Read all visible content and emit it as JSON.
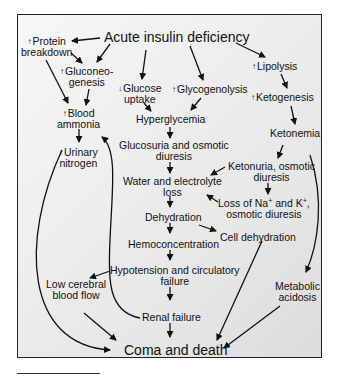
{
  "diagram": {
    "title_node": "Acute insulin deficiency",
    "nodes": {
      "protein_breakdown": {
        "prefix": "↑",
        "line1": "Protein",
        "line2": "breakdown"
      },
      "gluconeogenesis": {
        "prefix": "↑",
        "line1": "Gluconeo-",
        "line2": "genesis"
      },
      "glucose_uptake": {
        "prefix": "↓",
        "line1": "Glucose",
        "line2": "uptake"
      },
      "glycogenolysis": {
        "prefix": "↑",
        "line1": "Glycogenolysis"
      },
      "lipolysis": {
        "prefix": "↑",
        "line1": "Lipolysis"
      },
      "ketogenesis": {
        "prefix": "↑",
        "line1": "Ketogenesis"
      },
      "blood_ammonia": {
        "prefix": "↑",
        "line1": "Blood",
        "line2": "ammonia"
      },
      "urinary_nitrogen": {
        "prefix": "↑",
        "line1": "Urinary",
        "line2": "nitrogen"
      },
      "hyperglycemia": {
        "line1": "Hyperglycemia"
      },
      "ketonemia": {
        "line1": "Ketonemia"
      },
      "glucosuria": {
        "line1": "Glucosuria and osmotic",
        "line2": "diuresis"
      },
      "ketonuria": {
        "line1": "Ketonuria, osmotic",
        "line2": "diuresis"
      },
      "water_loss": {
        "line1": "Water and electrolyte",
        "line2": "loss"
      },
      "loss_na_k": {
        "line1a": "Loss of Na",
        "sup1": "+",
        "line1b": " and K",
        "sup2": "+",
        "line1c": ",",
        "line2": "osmotic diuresis"
      },
      "dehydration": {
        "line1": "Dehydration"
      },
      "cell_dehydration": {
        "line1": "Cell dehydration"
      },
      "hemoconcentration": {
        "line1": "Hemoconcentration"
      },
      "hypotension": {
        "line1": "Hypotension and circulatory",
        "line2": "failure"
      },
      "low_cerebral": {
        "line1": "Low cerebral",
        "line2": "blood flow"
      },
      "renal_failure": {
        "line1": "Renal failure"
      },
      "metabolic_acidosis": {
        "line1": "Metabolic",
        "line2": "acidosis"
      },
      "coma_death": {
        "line1": "Coma and death"
      }
    },
    "edges": [
      [
        "Acute insulin deficiency",
        "Protein breakdown"
      ],
      [
        "Acute insulin deficiency",
        "Gluconeogenesis"
      ],
      [
        "Acute insulin deficiency",
        "Glucose uptake"
      ],
      [
        "Acute insulin deficiency",
        "Glycogenolysis"
      ],
      [
        "Acute insulin deficiency",
        "Lipolysis"
      ],
      [
        "Protein breakdown",
        "Gluconeogenesis"
      ],
      [
        "Protein breakdown",
        "Blood ammonia"
      ],
      [
        "Gluconeogenesis",
        "Blood ammonia"
      ],
      [
        "Blood ammonia",
        "Urinary nitrogen"
      ],
      [
        "Blood ammonia",
        "Coma and death"
      ],
      [
        "Glucose uptake",
        "Hyperglycemia"
      ],
      [
        "Glycogenolysis",
        "Hyperglycemia"
      ],
      [
        "Lipolysis",
        "Ketogenesis"
      ],
      [
        "Ketogenesis",
        "Ketonemia"
      ],
      [
        "Hyperglycemia",
        "Glucosuria and osmotic diuresis"
      ],
      [
        "Glucosuria and osmotic diuresis",
        "Water and electrolyte loss"
      ],
      [
        "Ketonemia",
        "Ketonuria, osmotic diuresis"
      ],
      [
        "Ketonemia",
        "Metabolic acidosis"
      ],
      [
        "Ketonuria, osmotic diuresis",
        "Water and electrolyte loss"
      ],
      [
        "Ketonuria, osmotic diuresis",
        "Loss of Na+ and K+, osmotic diuresis"
      ],
      [
        "Loss of Na+ and K+, osmotic diuresis",
        "Water and electrolyte loss"
      ],
      [
        "Water and electrolyte loss",
        "Dehydration"
      ],
      [
        "Dehydration",
        "Cell dehydration"
      ],
      [
        "Dehydration",
        "Hemoconcentration"
      ],
      [
        "Hemoconcentration",
        "Hypotension and circulatory failure"
      ],
      [
        "Hypotension and circulatory failure",
        "Low cerebral blood flow"
      ],
      [
        "Hypotension and circulatory failure",
        "Renal failure"
      ],
      [
        "Renal failure",
        "Blood ammonia"
      ],
      [
        "Renal failure",
        "Coma and death"
      ],
      [
        "Low cerebral blood flow",
        "Coma and death"
      ],
      [
        "Cell dehydration",
        "Coma and death"
      ],
      [
        "Metabolic acidosis",
        "Coma and death"
      ]
    ]
  }
}
